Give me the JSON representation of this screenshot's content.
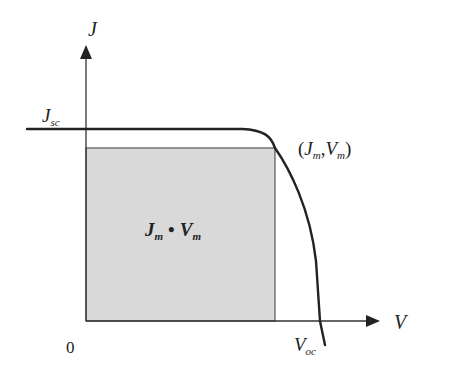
{
  "diagram": {
    "colors": {
      "background": "#ffffff",
      "line": "#222222",
      "axis": "#333333",
      "rect_fill": "#d9d9d9",
      "rect_stroke": "#555555"
    },
    "axes": {
      "origin": {
        "x": 86,
        "y": 321
      },
      "y_axis": {
        "top": 45,
        "label": "J",
        "label_pos": {
          "x": 88,
          "y": 26
        }
      },
      "x_axis": {
        "right": 380,
        "label": "V",
        "label_pos": {
          "x": 394,
          "y": 329
        }
      },
      "origin_label": "0",
      "origin_label_pos": {
        "x": 66,
        "y": 353
      }
    },
    "labels": {
      "jsc": {
        "main": "J",
        "sub": "sc",
        "x": 42,
        "y": 128
      },
      "voc": {
        "main": "V",
        "sub": "oc",
        "x": 294,
        "y": 353
      },
      "mpp": {
        "open": "(",
        "j_main": "J",
        "j_sub": "m",
        "comma": ",",
        "v_main": "V",
        "v_sub": "m",
        "close": ")",
        "x": 298,
        "y": 155
      },
      "area": {
        "j_main": "J",
        "j_sub": "m",
        "dot": "•",
        "v_main": "V",
        "v_sub": "m",
        "x": 145,
        "y": 236
      }
    },
    "curve": {
      "jsc_y": 129,
      "start_x": 27,
      "flat_end_x": 242,
      "mpp": {
        "x": 275,
        "y": 148
      },
      "voc_x": 320,
      "end": {
        "x": 325,
        "y": 345
      }
    },
    "rect": {
      "x": 86,
      "y": 148,
      "width": 189,
      "height": 173
    }
  }
}
